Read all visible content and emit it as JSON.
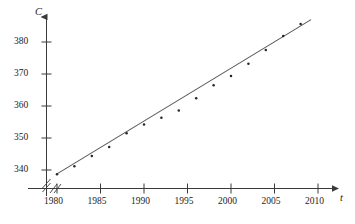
{
  "chart_data": {
    "type": "scatter",
    "title": "",
    "xlabel": "t",
    "ylabel": "C",
    "xlim": [
      1978.2,
      2011.5
    ],
    "ylim": [
      336.0,
      385.5
    ],
    "grid": false,
    "legend": null,
    "axis_break": {
      "x": true,
      "y": true,
      "symbol": "//"
    },
    "xticks": [
      1980,
      1985,
      1990,
      1995,
      2000,
      2005,
      2010
    ],
    "xtick_labels": [
      "1980",
      "1985",
      "1990",
      "1995",
      "2000",
      "2005",
      "2010"
    ],
    "yticks": [
      340,
      350,
      360,
      370,
      380
    ],
    "ytick_labels": [
      "340",
      "350",
      "360",
      "370",
      "380"
    ],
    "points": [
      {
        "x": 1980,
        "y": 338.7
      },
      {
        "x": 1982,
        "y": 341.2
      },
      {
        "x": 1984,
        "y": 344.4
      },
      {
        "x": 1986,
        "y": 347.2
      },
      {
        "x": 1988,
        "y": 351.5
      },
      {
        "x": 1990,
        "y": 354.2
      },
      {
        "x": 1992,
        "y": 356.3
      },
      {
        "x": 1994,
        "y": 358.6
      },
      {
        "x": 1996,
        "y": 362.4
      },
      {
        "x": 1998,
        "y": 366.5
      },
      {
        "x": 2000,
        "y": 369.4
      },
      {
        "x": 2002,
        "y": 373.2
      },
      {
        "x": 2004,
        "y": 377.5
      },
      {
        "x": 2006,
        "y": 381.9
      },
      {
        "x": 2008,
        "y": 385.6
      }
    ],
    "trendline": {
      "kind": "linear-fit",
      "x_start": 1980,
      "y_start": 338.8,
      "x_end": 2009.2,
      "y_end": 387.0
    }
  },
  "axes": {
    "y_axis_name": "C",
    "x_axis_name": "t"
  },
  "icons": {
    "y_arrow": "arrow-up-icon",
    "x_arrow": "arrow-right-icon",
    "break_mark": "axis-break-icon"
  }
}
